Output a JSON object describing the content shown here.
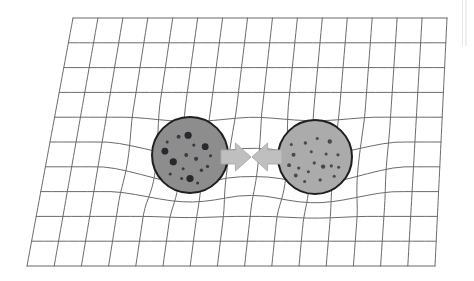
{
  "figure": {
    "description": "Two massive spheres rest on a flexible grid surface drawn in perspective; the grid sags beneath each sphere and two broad gray arrows between them point inward, indicating mutual attraction.",
    "background_color": "#ffffff",
    "width": 474,
    "height": 281
  },
  "grid": {
    "label": "spacetime-grid",
    "line_color": "#6b6b6b",
    "line_width": 1.0,
    "columns": 15,
    "rows": 10,
    "corners": {
      "top_left": [
        73,
        18
      ],
      "top_right": [
        447,
        18
      ],
      "bottom_right": [
        435,
        266
      ],
      "bottom_left": [
        27,
        266
      ]
    },
    "deformation": {
      "type": "two-well-sag",
      "well_centers": [
        [
          190,
          162
        ],
        [
          315,
          164
        ]
      ],
      "well_radius": 92,
      "max_vertical_sag": 17,
      "max_horizontal_pull": 7
    }
  },
  "bodies": [
    {
      "name": "left-mass-sphere",
      "label": "Mass 1",
      "center": [
        190,
        155
      ],
      "radius": 38,
      "fill_color": "#8d8d8d",
      "outline_color": "#1f1f1f",
      "outline_width": 2.0,
      "speckle_color": "#23232a",
      "speckle_count": 17
    },
    {
      "name": "right-mass-sphere",
      "label": "Mass 2",
      "center": [
        315,
        157
      ],
      "radius": 37,
      "fill_color": "#ababab",
      "outline_color": "#1f1f1f",
      "outline_width": 2.0,
      "speckle_color": "#2b2b33",
      "speckle_count": 19
    }
  ],
  "arrows": [
    {
      "name": "left-attraction-arrow",
      "direction": "right",
      "tail_x": 221,
      "tip_x": 251,
      "center_y": 157,
      "shaft_half_height": 7,
      "head_half_height": 14,
      "fill_color": "#bfbfbf",
      "outline_color": "#a9a9a9"
    },
    {
      "name": "right-attraction-arrow",
      "direction": "left",
      "tail_x": 282,
      "tip_x": 252,
      "center_y": 157,
      "shaft_half_height": 7,
      "head_half_height": 14,
      "fill_color": "#bfbfbf",
      "outline_color": "#a9a9a9"
    }
  ],
  "artifacts": {
    "scan_edge_color": "#dcdcdc",
    "scan_edge_note": "faint vertical page-scan edge near right border"
  }
}
